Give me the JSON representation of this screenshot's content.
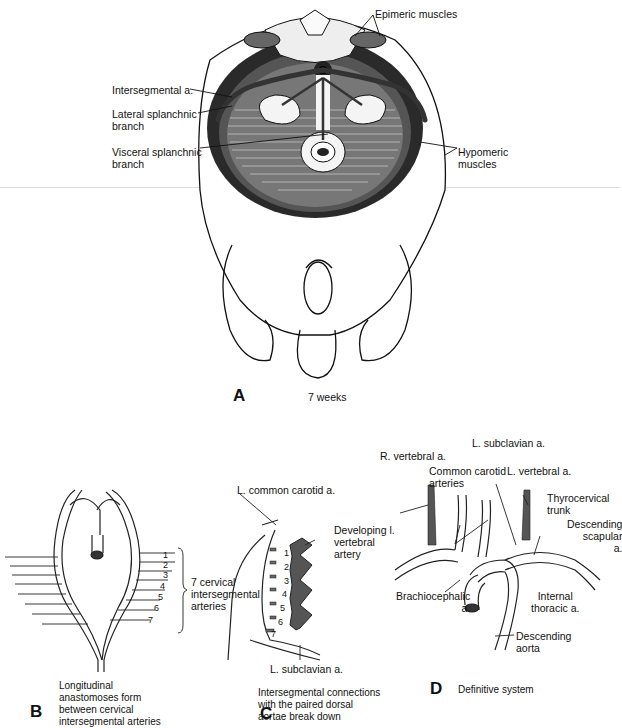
{
  "figure": {
    "panels": [
      {
        "id": "A",
        "letter": "A",
        "caption": "7 weeks",
        "labels": {
          "epimeric": "Epimeric muscles",
          "intersegmental": "Intersegmental a.",
          "lateral": "Lateral splanchnic\nbranch",
          "visceral": "Visceral splanchnic\nbranch",
          "hypomeric": "Hypomeric\nmuscles"
        }
      },
      {
        "id": "B",
        "letter": "B",
        "caption": "Longitudinal\nanastomoses form\nbetween cervical\nintersegmental arteries",
        "labels": {
          "bracket": "7 cervical\nintersegmental\narteries",
          "numbers": [
            "1",
            "2",
            "3",
            "4",
            "5",
            "6",
            "7"
          ]
        }
      },
      {
        "id": "C",
        "letter": "C",
        "caption": "Intersegmental connections\nwith the paired dorsal\naortae break down",
        "labels": {
          "carotid": "L. common carotid a.",
          "vertebral": "Developing l.\nvertebral\nartery",
          "subclavian": "L. subclavian a.",
          "numbers": [
            "1",
            "2",
            "3",
            "4",
            "5",
            "6",
            "7"
          ]
        }
      },
      {
        "id": "D",
        "letter": "D",
        "caption": "Definitive system",
        "labels": {
          "l_subclavian": "L. subclavian a.",
          "r_vertebral": "R. vertebral a.",
          "common_carotid": "Common carotid\narteries",
          "l_vertebral": "L. vertebral a.",
          "thyrocervical": "Thyrocervical\ntrunk",
          "desc_scapular": "Descending\nscapular\na.",
          "brachiocephalic": "Brachiocephalic\na.",
          "internal_thoracic": "Internal\nthoracic a.",
          "desc_aorta": "Descending\naorta"
        }
      }
    ]
  }
}
